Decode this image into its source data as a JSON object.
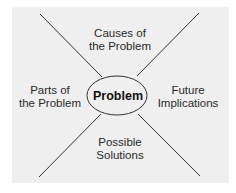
{
  "diagram": {
    "center": {
      "label": "Problem"
    },
    "quadrants": {
      "top": {
        "line1": "Causes of",
        "line2": "the Problem"
      },
      "left": {
        "line1": "Parts of",
        "line2": "the Problem"
      },
      "right": {
        "line1": "Future",
        "line2": "Implications"
      },
      "bottom": {
        "line1": "Possible",
        "line2": "Solutions"
      }
    },
    "colors": {
      "background": "#efefef",
      "line": "#333333",
      "text": "#2a2a2a"
    }
  }
}
